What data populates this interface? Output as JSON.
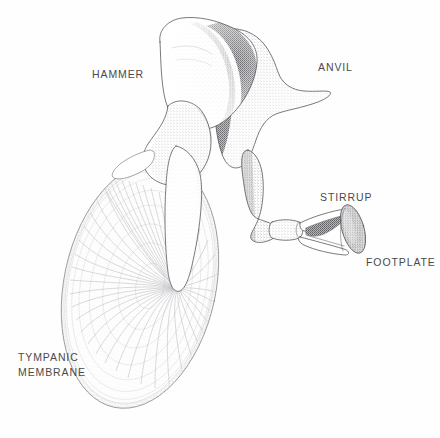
{
  "figure": {
    "style": "stippled pen-and-ink anatomical illustration",
    "background_color": "#fefefe",
    "ink_color": "#4f4f52",
    "label_color": "#4a4a4a"
  },
  "labels": [
    {
      "id": "hammer",
      "text": "HAMMER",
      "anatomical_name": "malleus",
      "x": 92,
      "y": 67
    },
    {
      "id": "anvil",
      "text": "ANVIL",
      "anatomical_name": "incus",
      "x": 318,
      "y": 60
    },
    {
      "id": "stirrup",
      "text": "STIRRUP",
      "anatomical_name": "stapes",
      "x": 320,
      "y": 190
    },
    {
      "id": "footplate",
      "text": "FOOTPLATE",
      "anatomical_name": "stapes footplate",
      "x": 366,
      "y": 255
    },
    {
      "id": "tympanic-membrane",
      "text": "TYMPANIC\nMEMBRANE",
      "anatomical_name": "eardrum",
      "x": 18,
      "y": 350
    }
  ],
  "structures": [
    {
      "id": "tympanic-membrane-shape",
      "name": "tympanic membrane",
      "form": "tilted ellipse with radial fibers converging at the umbo",
      "center_x": 140,
      "center_y": 285,
      "radius_x": 76,
      "radius_y": 125,
      "rotation_deg": 12,
      "umbo_x": 178,
      "umbo_y": 288,
      "radial_fiber_count": 46,
      "ring_fiber_count": 9
    },
    {
      "id": "malleus-shape",
      "name": "hammer (malleus)",
      "form": "rounded head at top, narrow neck, long tapering manubrium descending to the umbo",
      "head_top_y": 18,
      "manubrium_tip_x": 178,
      "manubrium_tip_y": 290
    },
    {
      "id": "incus-shape",
      "name": "anvil (incus)",
      "form": "triangular body with pointed short process to the right and long process curving down to the stapes",
      "short_process_tip_x": 330,
      "short_process_tip_y": 92,
      "long_process_end_x": 272,
      "long_process_end_y": 230
    },
    {
      "id": "stapes-shape",
      "name": "stirrup (stapes)",
      "form": "head and neck, two crura forming an arch, oval footplate at the far end",
      "head_x": 276,
      "head_y": 230,
      "footplate_center_x": 353,
      "footplate_center_y": 229,
      "footplate_tilt_deg": -18
    }
  ]
}
